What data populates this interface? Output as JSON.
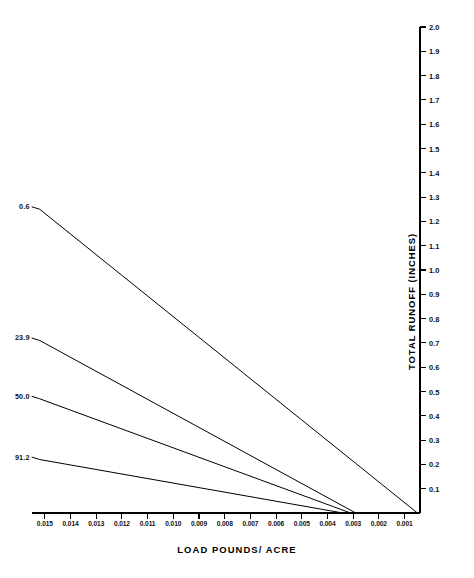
{
  "chart_data": {
    "type": "line",
    "title": "",
    "xlabel": "LOAD POUNDS/ ACRE",
    "ylabel": "TOTAL RUNOFF (INCHES)",
    "x_tick_labels": [
      "0.015",
      "0.014",
      "0.013",
      "0.012",
      "0.011",
      "0.010",
      "0.009",
      "0.008",
      "0.007",
      "0.006",
      "0.005",
      "0.004",
      "0.003",
      "0.002",
      "0.001"
    ],
    "x_tick_values": [
      0.015,
      0.014,
      0.013,
      0.012,
      0.011,
      0.01,
      0.009,
      0.008,
      0.007,
      0.006,
      0.005,
      0.004,
      0.003,
      0.002,
      0.001
    ],
    "y_tick_labels": [
      "2.0",
      "1.9",
      "1.8",
      "1.7",
      "1.6",
      "1.5",
      "1.4",
      "1.3",
      "1.2",
      "1.1",
      "1.0",
      "0.9",
      "0.8",
      "0.7",
      "0.6",
      "0.5",
      "0.4",
      "0.3",
      "0.2",
      "0.1"
    ],
    "y_tick_values": [
      2.0,
      1.9,
      1.8,
      1.7,
      1.6,
      1.5,
      1.4,
      1.3,
      1.2,
      1.1,
      1.0,
      0.9,
      0.8,
      0.7,
      0.6,
      0.5,
      0.4,
      0.3,
      0.2,
      0.1
    ],
    "xlim": [
      0.0155,
      0.0004
    ],
    "ylim": [
      0.0,
      2.05
    ],
    "x_axis_direction": "descending",
    "y_axis_position": "right",
    "grid": false,
    "legend": "inline-left-labels",
    "series": [
      {
        "name": "0.6",
        "label": "0.6",
        "x": [
          0.0152,
          0.0005
        ],
        "values": [
          1.25,
          0.0
        ]
      },
      {
        "name": "23.9",
        "label": "23.9",
        "x": [
          0.0152,
          0.0029
        ],
        "values": [
          0.71,
          0.0
        ]
      },
      {
        "name": "50.0",
        "label": "50.0",
        "x": [
          0.0152,
          0.0031
        ],
        "values": [
          0.47,
          0.0
        ]
      },
      {
        "name": "91.2",
        "label": "91.2",
        "x": [
          0.0152,
          0.0034
        ],
        "values": [
          0.22,
          0.0
        ]
      }
    ],
    "colors": {
      "line": "#000000",
      "axis": "#000000",
      "background": "#ffffff"
    }
  }
}
